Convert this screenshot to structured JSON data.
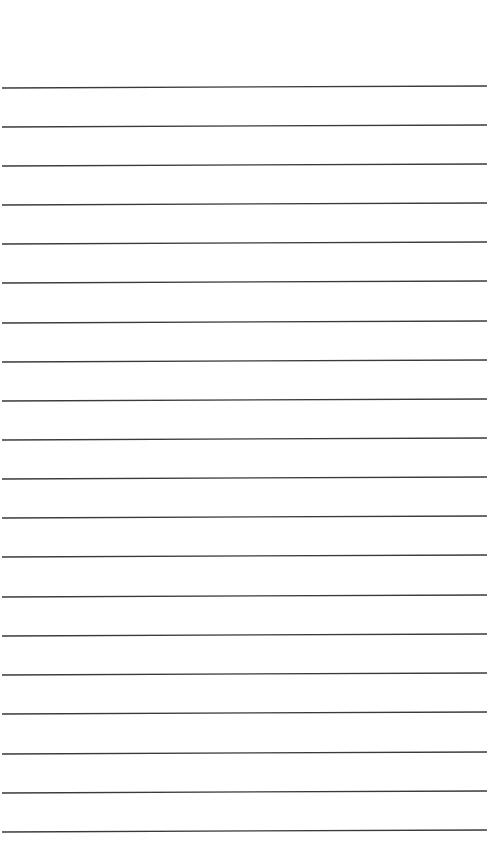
{
  "paper": {
    "background": "#ffffff",
    "line_color": "#3a3a3a",
    "line_count": 20,
    "lines_left_y": [
      88,
      127,
      166,
      205,
      244,
      283,
      323,
      362,
      401,
      440,
      479,
      518,
      557,
      597,
      636,
      675,
      714,
      754,
      793,
      832
    ],
    "tilt_px": -2
  }
}
